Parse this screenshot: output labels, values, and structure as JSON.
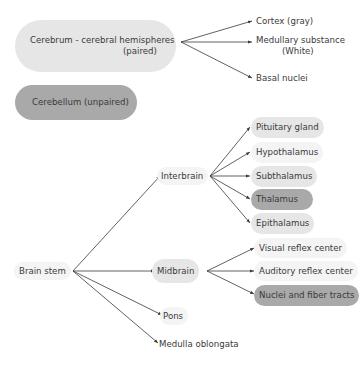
{
  "diagram": {
    "type": "tree",
    "top_groups": [
      {
        "id": "cerebrum",
        "label_line1": "Cerebrum - cerebral hemispheres",
        "label_line2": "(paired)",
        "shade": "light",
        "children": [
          {
            "label_line1": "Cortex (gray)"
          },
          {
            "label_line1": "Medullary substance",
            "label_line2": "(White)"
          },
          {
            "label_line1": "Basal nuclei"
          }
        ]
      },
      {
        "id": "cerebellum",
        "label": "Cerebellum (unpaired)",
        "shade": "dark"
      }
    ],
    "brain_stem": {
      "label": "Brain stem",
      "children": [
        {
          "label": "Interbrain",
          "children": [
            {
              "label": "Pituitary gland",
              "shade": "light"
            },
            {
              "label": "Hypothalamus",
              "shade": "faint"
            },
            {
              "label": "Subthalamus",
              "shade": "light"
            },
            {
              "label": "Thalamus",
              "shade": "dark"
            },
            {
              "label": "Epithalamus",
              "shade": "light"
            }
          ]
        },
        {
          "label": "Midbrain",
          "shade": "light",
          "children": [
            {
              "label": "Visual reflex center",
              "shade": "faint"
            },
            {
              "label": "Auditory reflex center",
              "shade": "faint"
            },
            {
              "label": "Nuclei and fiber tracts",
              "shade": "dark"
            }
          ]
        },
        {
          "label": "Pons",
          "shade": "faint"
        },
        {
          "label": "Medulla oblongata",
          "shade": "none"
        }
      ]
    },
    "colors": {
      "light": "#e6e6e6",
      "dark": "#a9a9a9",
      "faint": "#f4f4f4",
      "line": "#3a3a3a",
      "text": "#3a3a3a"
    }
  }
}
